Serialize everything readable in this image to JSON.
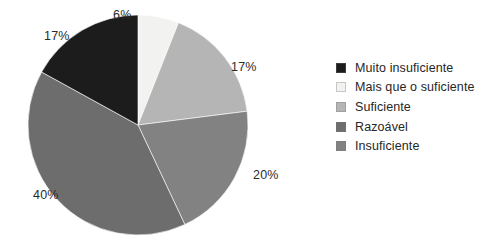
{
  "chart_data": {
    "type": "pie",
    "title": "",
    "labels": [
      "Muito insuficiente",
      "Mais que o suficiente",
      "Suficiente",
      "Razoável",
      "Insuficiente"
    ],
    "values": [
      17,
      6,
      17,
      40,
      20
    ],
    "value_labels": [
      "17%",
      "6%",
      "17%",
      "40%",
      "20%"
    ],
    "colors": [
      "#1c1c1c",
      "#f2f2f0",
      "#b5b5b5",
      "#6d6d6d",
      "#828282"
    ],
    "legend_position": "right",
    "start_angle_deg": -90,
    "direction": "clockwise",
    "slices_clockwise_from_top": [
      {
        "label": "Mais que o suficiente",
        "value": 6,
        "value_label": "6%",
        "color": "#f2f2f0"
      },
      {
        "label": "Suficiente",
        "value": 17,
        "value_label": "17%",
        "color": "#b5b5b5"
      },
      {
        "label": "Insuficiente",
        "value": 20,
        "value_label": "20%",
        "color": "#828282"
      },
      {
        "label": "Razoável",
        "value": 40,
        "value_label": "40%",
        "color": "#6d6d6d"
      },
      {
        "label": "Muito insuficiente",
        "value": 17,
        "value_label": "17%",
        "color": "#1c1c1c"
      }
    ]
  },
  "pie": {
    "labels": {
      "top": "6%",
      "top_left": "17%",
      "right": "17%",
      "bottom_right": "20%",
      "bottom_left": "40%"
    }
  },
  "legend": {
    "items": [
      {
        "label": "Muito insuficiente",
        "color": "#1c1c1c"
      },
      {
        "label": "Mais que o suficiente",
        "color": "#f2f2f0"
      },
      {
        "label": "Suficiente",
        "color": "#b5b5b5"
      },
      {
        "label": "Razoável",
        "color": "#6d6d6d"
      },
      {
        "label": "Insuficiente",
        "color": "#828282"
      }
    ]
  }
}
